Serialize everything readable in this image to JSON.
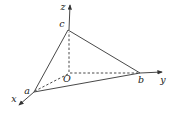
{
  "figure": {
    "background_color": "#ffffff",
    "line_color": "#333333",
    "label_color": "#1a1a1a",
    "canvas": {
      "width": 176,
      "height": 120
    },
    "points": {
      "origin": {
        "x": 69,
        "y": 73
      },
      "a": {
        "x": 34,
        "y": 92
      },
      "b": {
        "x": 140,
        "y": 73
      },
      "c": {
        "x": 68,
        "y": 30
      }
    },
    "axes": [
      {
        "name": "x-axis",
        "x1": 34,
        "y1": 92,
        "x2": 19,
        "y2": 105
      },
      {
        "name": "y-axis",
        "x1": 140,
        "y1": 73,
        "x2": 162,
        "y2": 72
      },
      {
        "name": "z-axis",
        "x1": 69,
        "y1": 30,
        "x2": 70,
        "y2": 5
      }
    ],
    "triangle_edges": [
      {
        "name": "edge-a-c",
        "x1": 34,
        "y1": 92,
        "x2": 68,
        "y2": 30
      },
      {
        "name": "edge-c-b",
        "x1": 68,
        "y1": 30,
        "x2": 140,
        "y2": 73
      },
      {
        "name": "edge-a-b",
        "x1": 34,
        "y1": 92,
        "x2": 140,
        "y2": 73
      }
    ],
    "hidden_edges": [
      {
        "name": "segment-O-c",
        "x1": 69,
        "y1": 72,
        "x2": 69,
        "y2": 32
      },
      {
        "name": "segment-O-b",
        "x1": 70,
        "y1": 73,
        "x2": 138,
        "y2": 73
      },
      {
        "name": "segment-O-a",
        "x1": 68,
        "y1": 74,
        "x2": 35,
        "y2": 91
      }
    ],
    "labels": [
      {
        "name": "label-z",
        "text": "z",
        "x": 63,
        "y": 10
      },
      {
        "name": "label-c",
        "text": "c",
        "x": 62,
        "y": 27
      },
      {
        "name": "label-O",
        "text": "O",
        "x": 67,
        "y": 82
      },
      {
        "name": "label-a",
        "text": "a",
        "x": 27,
        "y": 94
      },
      {
        "name": "label-x",
        "text": "x",
        "x": 14,
        "y": 102
      },
      {
        "name": "label-b",
        "text": "b",
        "x": 141,
        "y": 83
      },
      {
        "name": "label-y",
        "text": "y",
        "x": 163,
        "y": 83
      }
    ]
  }
}
